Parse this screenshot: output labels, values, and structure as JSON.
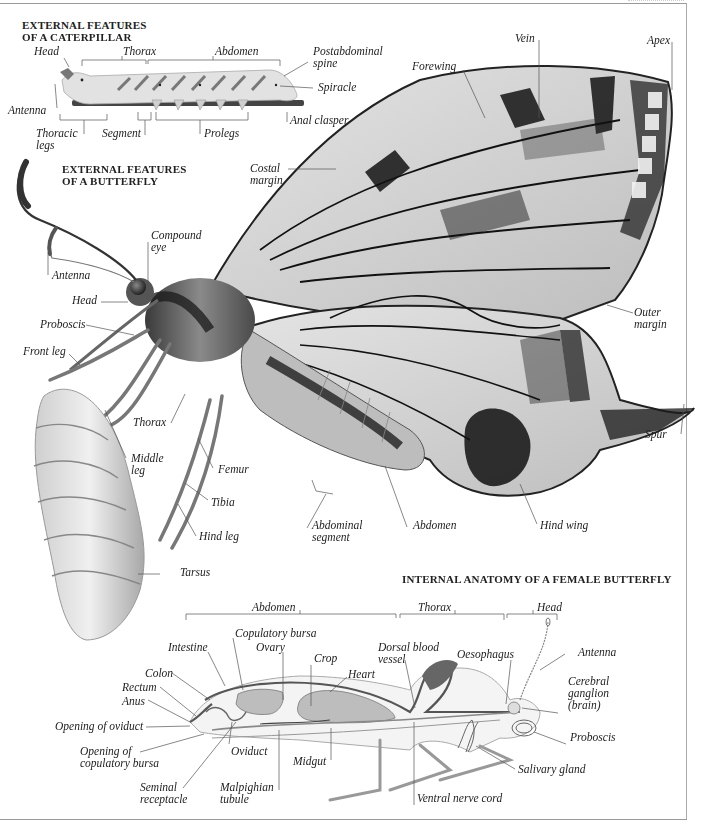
{
  "caterpillar": {
    "title_line1": "EXTERNAL FEATURES",
    "title_line2": "OF A CATERPILLAR",
    "labels": {
      "head": "Head",
      "thorax": "Thorax",
      "abdomen": "Abdomen",
      "postabdominal_spine_1": "Postabdominal",
      "postabdominal_spine_2": "spine",
      "spiracle": "Spiracle",
      "antenna": "Antenna",
      "anal_clasper": "Anal clasper",
      "thoracic_legs_1": "Thoracic",
      "thoracic_legs_2": "legs",
      "segment": "Segment",
      "prolegs": "Prolegs"
    }
  },
  "butterfly": {
    "title_line1": "EXTERNAL FEATURES",
    "title_line2": "OF A BUTTERFLY",
    "labels": {
      "vein": "Vein",
      "apex": "Apex",
      "forewing": "Forewing",
      "costal_margin_1": "Costal",
      "costal_margin_2": "margin",
      "compound_eye_1": "Compound",
      "compound_eye_2": "eye",
      "antenna": "Antenna",
      "head": "Head",
      "proboscis": "Proboscis",
      "front_leg": "Front leg",
      "outer_margin_1": "Outer",
      "outer_margin_2": "margin",
      "thorax": "Thorax",
      "middle_leg_1": "Middle",
      "middle_leg_2": "leg",
      "femur": "Femur",
      "tibia": "Tibia",
      "hind_leg": "Hind leg",
      "spur": "Spur",
      "tarsus": "Tarsus",
      "abdominal_segment_1": "Abdominal",
      "abdominal_segment_2": "segment",
      "abdomen": "Abdomen",
      "hind_wing": "Hind wing"
    }
  },
  "internal": {
    "title": "INTERNAL ANATOMY OF A FEMALE BUTTERFLY",
    "regions": {
      "abdomen": "Abdomen",
      "thorax": "Thorax",
      "head": "Head"
    },
    "labels": {
      "copulatory_bursa": "Copulatory bursa",
      "intestine": "Intestine",
      "ovary": "Ovary",
      "crop": "Crop",
      "heart": "Heart",
      "dorsal_blood_vessel_1": "Dorsal blood",
      "dorsal_blood_vessel_2": "vessel",
      "oesophagus": "Oesophagus",
      "antenna": "Antenna",
      "colon": "Colon",
      "rectum": "Rectum",
      "anus": "Anus",
      "cerebral_ganglion_1": "Cerebral",
      "cerebral_ganglion_2": "ganglion",
      "cerebral_ganglion_3": "(brain)",
      "opening_of_oviduct": "Opening of oviduct",
      "proboscis": "Proboscis",
      "opening_copulatory_bursa_1": "Opening of",
      "opening_copulatory_bursa_2": "copulatory bursa",
      "oviduct": "Oviduct",
      "midgut": "Midgut",
      "salivary_gland": "Salivary gland",
      "seminal_receptacle_1": "Seminal",
      "seminal_receptacle_2": "receptacle",
      "malpighian_tubule_1": "Malpighian",
      "malpighian_tubule_2": "tubule",
      "ventral_nerve_cord": "Ventral nerve cord"
    }
  },
  "colors": {
    "text": "#222222",
    "leader_line": "#555555",
    "frame": "#999999",
    "wing_dark": "#1e1e1e",
    "wing_light": "#d6d6d6",
    "organ_fill": "#bdbdbd"
  }
}
